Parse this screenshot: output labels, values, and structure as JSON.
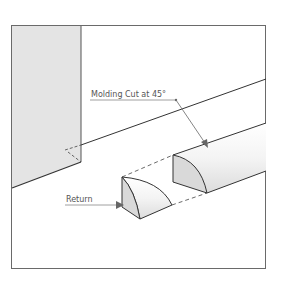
{
  "diagram": {
    "labels": {
      "molding_cut": "Molding Cut at 45°",
      "return": "Return"
    },
    "colors": {
      "frame": "#6a6a6a",
      "wall_fill": "#e6e6e6",
      "line": "#333333",
      "leader": "#777777",
      "text": "#555555",
      "molding_face": "#d9d9d9",
      "molding_body": "#f2f2f2"
    }
  }
}
